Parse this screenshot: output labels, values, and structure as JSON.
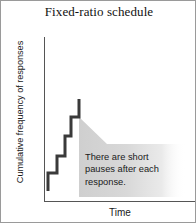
{
  "figure": {
    "title": "Fixed-ratio schedule",
    "border_color": "#9a9a9a",
    "background": "#ffffff"
  },
  "axes": {
    "y_label": "Cumulative frequency of responses",
    "x_label": "Time",
    "axis_color": "#555555",
    "y_axis_visible": true,
    "x_axis_visible": true,
    "top_border_visible": false,
    "right_border_visible": false,
    "tick_labels_visible": false
  },
  "annotation": {
    "text": "There are short pauses after each response.",
    "fill_color": "#d4d4d4",
    "tail_direction": "up-left",
    "gradient": "fades to transparent toward right"
  },
  "chart_data": {
    "type": "line",
    "title": "Fixed-ratio schedule",
    "xlabel": "Time",
    "ylabel": "Cumulative frequency of responses",
    "series": [
      {
        "name": "Cumulative responses (fixed-ratio)",
        "style": "staircase",
        "line_color": "#3a3a3a",
        "line_width": 3,
        "points": [
          {
            "x": 47,
            "y": 190
          },
          {
            "x": 47,
            "y": 172
          },
          {
            "x": 56,
            "y": 172
          },
          {
            "x": 56,
            "y": 155
          },
          {
            "x": 64,
            "y": 155
          },
          {
            "x": 64,
            "y": 135
          },
          {
            "x": 70,
            "y": 135
          },
          {
            "x": 70,
            "y": 116
          },
          {
            "x": 78,
            "y": 116
          },
          {
            "x": 78,
            "y": 98
          }
        ]
      }
    ],
    "grid": false,
    "legend": false,
    "xlim": [
      43,
      196
    ],
    "ylim": [
      30,
      200
    ]
  }
}
